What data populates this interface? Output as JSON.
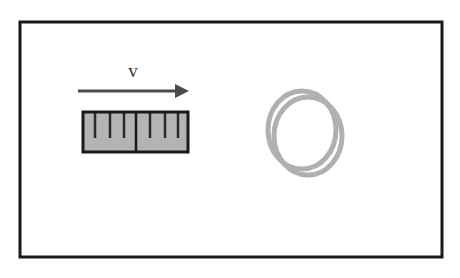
{
  "figure": {
    "background_color": "#ffffff",
    "width": 460,
    "height": 278
  },
  "frame": {
    "name": "figure-border",
    "stroke_color": "#1a1a1a",
    "stroke_width": 3,
    "x": 20,
    "y": 22,
    "width": 422,
    "height": 235,
    "fill": "#ffffff"
  },
  "velocity": {
    "label": "v",
    "label_x": 133,
    "label_y": 77,
    "label_color": "#3a3a3a",
    "arrow": {
      "name": "velocity-arrow",
      "color": "#4a4a4a",
      "shaft_start_x": 78,
      "shaft_end_x": 178,
      "shaft_y": 91,
      "shaft_width": 3,
      "head_tip_x": 189,
      "head_half_height": 7,
      "head_length": 14
    }
  },
  "magnet": {
    "name": "bar-magnet",
    "x": 83,
    "y": 112,
    "width": 105,
    "height": 40,
    "fill_color": "#b4b4b4",
    "stroke_color": "#1a1a1a",
    "stroke_width": 3,
    "divider": {
      "x": 136,
      "color": "#1a1a1a",
      "width": 2.5
    },
    "ticks": {
      "color": "#2a2a2a",
      "width": 2.5,
      "drop_length": 26,
      "x_positions": [
        95,
        110,
        124,
        150,
        165,
        178
      ]
    }
  },
  "coil": {
    "name": "conducting-coil",
    "stroke_color": "#b0b0b0",
    "stroke_width": 5,
    "loops": [
      {
        "cx": 302,
        "cy": 130,
        "rx": 34,
        "ry": 39
      },
      {
        "cx": 308,
        "cy": 136,
        "rx": 34,
        "ry": 39
      }
    ]
  }
}
